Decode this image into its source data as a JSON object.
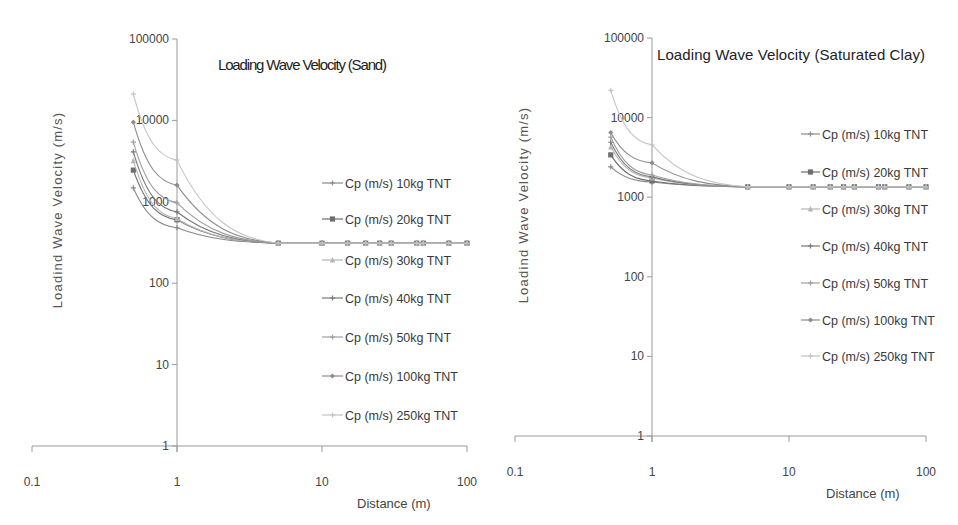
{
  "chart_data": [
    {
      "type": "line",
      "id": "sand",
      "title": "Loading Wave Velocity (Sand)",
      "xlabel": "Distance (m)",
      "ylabel": "Loadind Wave Velocity (m/s)",
      "xscale": "log",
      "yscale": "log",
      "xlim": [
        0.1,
        100
      ],
      "ylim": [
        1,
        100000
      ],
      "x_ticks": [
        "0.1",
        "1",
        "10",
        "100"
      ],
      "y_ticks": [
        "1",
        "10",
        "100",
        "1000",
        "10000",
        "100000"
      ],
      "grid": false,
      "legend_position": "right-inside",
      "x": [
        0.5,
        1,
        5,
        10,
        15,
        20,
        25,
        30,
        45,
        50,
        75,
        100
      ],
      "series": [
        {
          "name": "Cp (m/s) 10kg TNT",
          "marker": "plus",
          "color": "#8a8a8a",
          "values": [
            1480,
            480,
            310,
            310,
            310,
            310,
            310,
            310,
            310,
            310,
            310,
            310
          ]
        },
        {
          "name": "Cp (m/s) 20kg TNT",
          "marker": "square",
          "color": "#6e6e6e",
          "values": [
            2450,
            600,
            310,
            310,
            310,
            310,
            310,
            310,
            310,
            310,
            310,
            310
          ]
        },
        {
          "name": "Cp (m/s) 30kg TNT",
          "marker": "triangle",
          "color": "#b5b5b5",
          "values": [
            3200,
            620,
            310,
            310,
            310,
            310,
            310,
            310,
            310,
            310,
            310,
            310
          ]
        },
        {
          "name": "Cp (m/s) 40kg TNT",
          "marker": "plus",
          "color": "#7a7a7a",
          "values": [
            4100,
            750,
            310,
            310,
            310,
            310,
            310,
            310,
            310,
            310,
            310,
            310
          ]
        },
        {
          "name": "Cp (m/s) 50kg TNT",
          "marker": "plus",
          "color": "#a0a0a0",
          "values": [
            5400,
            970,
            310,
            310,
            310,
            310,
            310,
            310,
            310,
            310,
            310,
            310
          ]
        },
        {
          "name": "Cp (m/s) 100kg TNT",
          "marker": "diamond",
          "color": "#8c8c8c",
          "values": [
            9500,
            1600,
            310,
            310,
            310,
            310,
            310,
            310,
            310,
            310,
            310,
            310
          ]
        },
        {
          "name": "Cp (m/s) 250kg TNT",
          "marker": "plus",
          "color": "#c4c4c4",
          "values": [
            21000,
            3250,
            310,
            310,
            310,
            310,
            310,
            310,
            310,
            310,
            310,
            310
          ]
        }
      ]
    },
    {
      "type": "line",
      "id": "clay",
      "title": "Loading Wave Velocity (Saturated Clay)",
      "xlabel": "Distance (m)",
      "ylabel": "Loadind Wave Velocity (m/s)",
      "xscale": "log",
      "yscale": "log",
      "xlim": [
        0.1,
        100
      ],
      "ylim": [
        1,
        100000
      ],
      "x_ticks": [
        "0.1",
        "1",
        "10",
        "100"
      ],
      "y_ticks": [
        "1",
        "10",
        "100",
        "1000",
        "10000",
        "100000"
      ],
      "grid": false,
      "legend_position": "right-inside",
      "x": [
        0.5,
        1,
        5,
        10,
        15,
        20,
        25,
        30,
        45,
        50,
        75,
        100
      ],
      "series": [
        {
          "name": "Cp (m/s) 10kg TNT",
          "marker": "plus",
          "color": "#8a8a8a",
          "values": [
            2400,
            1550,
            1350,
            1350,
            1350,
            1350,
            1350,
            1350,
            1350,
            1350,
            1350,
            1350
          ]
        },
        {
          "name": "Cp (m/s) 20kg TNT",
          "marker": "square",
          "color": "#6e6e6e",
          "values": [
            3400,
            1600,
            1350,
            1350,
            1350,
            1350,
            1350,
            1350,
            1350,
            1350,
            1350,
            1350
          ]
        },
        {
          "name": "Cp (m/s) 30kg TNT",
          "marker": "triangle",
          "color": "#b5b5b5",
          "values": [
            4300,
            1750,
            1350,
            1350,
            1350,
            1350,
            1350,
            1350,
            1350,
            1350,
            1350,
            1350
          ]
        },
        {
          "name": "Cp (m/s) 40kg TNT",
          "marker": "plus",
          "color": "#7a7a7a",
          "values": [
            4900,
            1800,
            1350,
            1350,
            1350,
            1350,
            1350,
            1350,
            1350,
            1350,
            1350,
            1350
          ]
        },
        {
          "name": "Cp (m/s) 50kg TNT",
          "marker": "plus",
          "color": "#a0a0a0",
          "values": [
            5700,
            1900,
            1350,
            1350,
            1350,
            1350,
            1350,
            1350,
            1350,
            1350,
            1350,
            1350
          ]
        },
        {
          "name": "Cp (m/s) 100kg TNT",
          "marker": "diamond",
          "color": "#8c8c8c",
          "values": [
            6500,
            2700,
            1350,
            1350,
            1350,
            1350,
            1350,
            1350,
            1350,
            1350,
            1350,
            1350
          ]
        },
        {
          "name": "Cp (m/s) 250kg TNT",
          "marker": "plus",
          "color": "#c4c4c4",
          "values": [
            22000,
            4550,
            1350,
            1350,
            1350,
            1350,
            1350,
            1350,
            1350,
            1350,
            1350,
            1350
          ]
        }
      ]
    }
  ],
  "layout": {
    "charts": [
      {
        "x0": 32,
        "x1": 467,
        "y_top": 39,
        "y_bottom": 446,
        "yaxis_x": 177,
        "title_pos": [
          218,
          70
        ],
        "ylabel_pos": [
          62,
          210
        ],
        "xlabel_pos": [
          357,
          508
        ],
        "xtick_y": 486,
        "legend": {
          "x_line": 322,
          "x_text": 345,
          "ys": [
            183,
            219,
            260,
            298,
            337,
            376,
            415
          ]
        }
      },
      {
        "x0": 515,
        "x1": 926,
        "y_top": 38,
        "y_bottom": 436,
        "yaxis_x": 652,
        "title_pos": [
          657,
          60
        ],
        "ylabel_pos": [
          528,
          205
        ],
        "xlabel_pos": [
          826,
          498
        ],
        "xtick_y": 476,
        "legend": {
          "x_line": 801,
          "x_text": 822,
          "ys": [
            134,
            172,
            209,
            246,
            283,
            320,
            356
          ]
        }
      }
    ]
  }
}
